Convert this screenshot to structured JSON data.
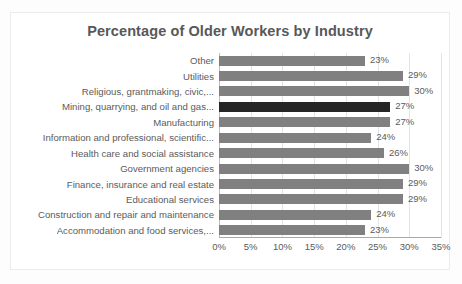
{
  "chart_data": {
    "type": "bar",
    "orientation": "horizontal",
    "title": "Percentage of Older Workers by Industry",
    "xlabel": "",
    "ylabel": "",
    "xlim": [
      0,
      35
    ],
    "xticks": [
      "0%",
      "5%",
      "10%",
      "15%",
      "20%",
      "25%",
      "30%",
      "35%"
    ],
    "xtick_values": [
      0,
      5,
      10,
      15,
      20,
      25,
      30,
      35
    ],
    "grid": true,
    "legend": false,
    "categories": [
      "Other",
      "Utilities",
      "Religious, grantmaking, civic,...",
      "Mining, quarrying, and oil and gas...",
      "Manufacturing",
      "Information and professional, scientific...",
      "Health care and social assistance",
      "Government agencies",
      "Finance, insurance and real estate",
      "Educational services",
      "Construction and repair and maintenance",
      "Accommodation and food services,..."
    ],
    "values": [
      23,
      29,
      30,
      27,
      27,
      24,
      26,
      30,
      29,
      29,
      24,
      23
    ],
    "value_labels": [
      "23%",
      "29%",
      "30%",
      "27%",
      "27%",
      "24%",
      "26%",
      "30%",
      "29%",
      "29%",
      "24%",
      "23%"
    ],
    "highlighted_index": 3,
    "colors": {
      "bar": "#808080",
      "bar_highlight": "#262626",
      "title_text": "#585858",
      "label_text": "#5b5b5b",
      "gridline": "#e4e4e4",
      "axis_line": "#a9a9a9",
      "frame_border": "#ececed",
      "plot_background": "#ffffff",
      "page_background": "#fdfdfd"
    }
  }
}
